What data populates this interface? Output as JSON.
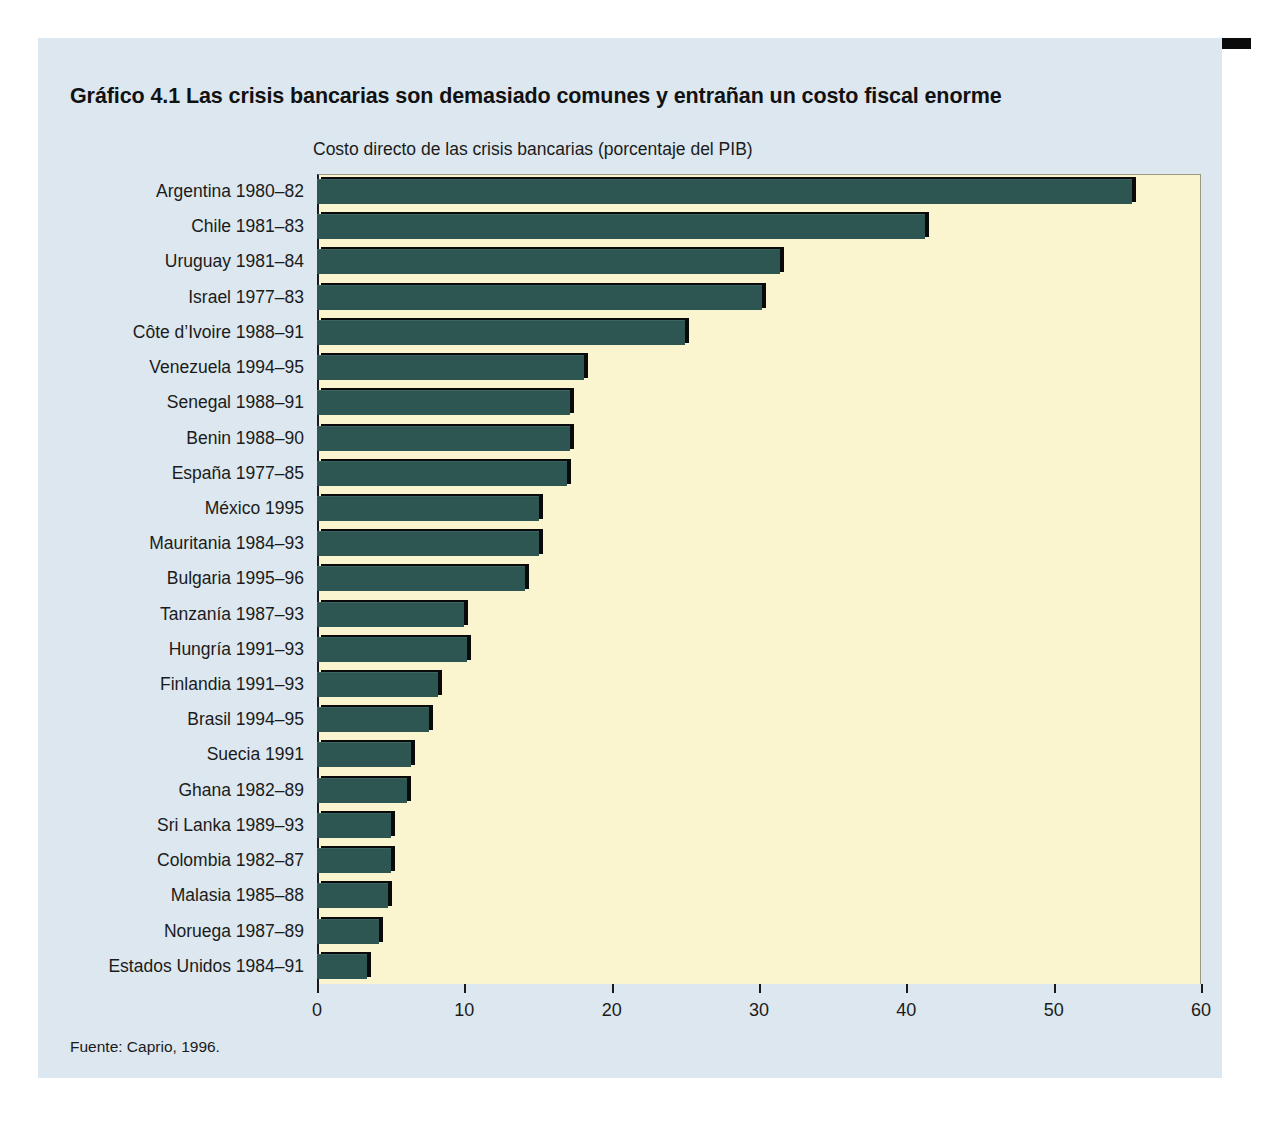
{
  "figure": {
    "label": "Gráfico 4.1",
    "title": "Gráfico 4.1  Las crisis bancarias son demasiado comunes y entrañan un costo fiscal enorme",
    "subtitle": "Costo directo de las crisis bancarias (porcentaje del PIB)",
    "source": "Fuente: Caprio, 1996."
  },
  "colors": {
    "panel_background": "#dce7ef",
    "plot_background": "#faf5cf",
    "bar_fill": "#2d5551",
    "bar_shadow": "#0a0a0a",
    "rule": "#0b0b0b",
    "text": "#1b1b1b"
  },
  "chart_data": {
    "type": "bar",
    "orientation": "horizontal",
    "title": "Gráfico 4.1  Las crisis bancarias son demasiado comunes y entrañan un costo fiscal enorme",
    "subtitle": "Costo directo de las crisis bancarias (porcentaje del PIB)",
    "xlabel": "",
    "ylabel": "",
    "xlim": [
      0,
      60
    ],
    "xticks": [
      0,
      10,
      20,
      30,
      40,
      50,
      60
    ],
    "xtick_labels": [
      "0",
      "10",
      "20",
      "30",
      "40",
      "50",
      "60"
    ],
    "grid": false,
    "legend": false,
    "source": "Fuente: Caprio, 1996.",
    "categories": [
      "Argentina 1980–82",
      "Chile 1981–83",
      "Uruguay 1981–84",
      "Israel 1977–83",
      "Côte d’Ivoire 1988–91",
      "Venezuela 1994–95",
      "Senegal 1988–91",
      "Benin 1988–90",
      "España 1977–85",
      "México 1995",
      "Mauritania 1984–93",
      "Bulgaria 1995–96",
      "Tanzanía 1987–93",
      "Hungría 1991–93",
      "Finlandia 1991–93",
      "Brasil 1994–95",
      "Suecia 1991",
      "Ghana 1982–89",
      "Sri Lanka 1989–93",
      "Colombia 1982–87",
      "Malasia 1985–88",
      "Noruega 1987–89",
      "Estados Unidos 1984–91"
    ],
    "values": [
      55.3,
      41.3,
      31.4,
      30.2,
      25.0,
      18.1,
      17.2,
      17.2,
      17.0,
      15.1,
      15.1,
      14.1,
      10.0,
      10.2,
      8.2,
      7.6,
      6.4,
      6.1,
      5.0,
      5.0,
      4.8,
      4.2,
      3.4
    ]
  }
}
